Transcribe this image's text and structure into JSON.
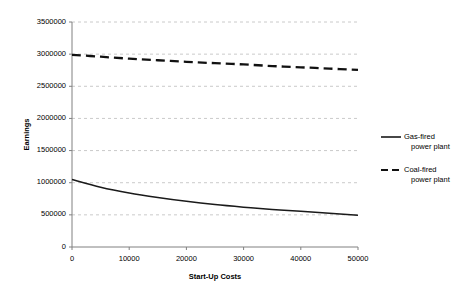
{
  "chart_data": {
    "type": "line",
    "title": "",
    "xlabel": "Start-Up Costs",
    "ylabel": "Earnings",
    "xlim": [
      0,
      50000
    ],
    "ylim": [
      0,
      3500000
    ],
    "xticks": [
      "0",
      "10000",
      "20000",
      "30000",
      "40000",
      "50000"
    ],
    "xtick_values": [
      0,
      10000,
      20000,
      30000,
      40000,
      50000
    ],
    "yticks": [
      "0",
      "500000",
      "1000000",
      "1500000",
      "2000000",
      "2500000",
      "3000000",
      "3500000"
    ],
    "ytick_values": [
      0,
      500000,
      1000000,
      1500000,
      2000000,
      2500000,
      3000000,
      3500000
    ],
    "grid": true,
    "grid_axis": "y",
    "grid_style": "dashed",
    "legend_position": "right",
    "x": [
      0,
      5000,
      10000,
      15000,
      20000,
      25000,
      30000,
      35000,
      40000,
      45000,
      50000
    ],
    "series": [
      {
        "name": "Gas-fired power plant",
        "style": "solid",
        "color": "#1a1a1a",
        "values": [
          1050000,
          930000,
          840000,
          770000,
          710000,
          660000,
          620000,
          585000,
          555000,
          525000,
          495000
        ]
      },
      {
        "name": "Coal-fired power plant",
        "style": "dashed",
        "color": "#111111",
        "values": [
          2990000,
          2960000,
          2930000,
          2905000,
          2880000,
          2860000,
          2840000,
          2815000,
          2795000,
          2775000,
          2755000
        ]
      }
    ]
  },
  "legend": {
    "entries": [
      {
        "line1": "Gas-fired",
        "line2": "power plant",
        "swatch": "solid-line-swatch"
      },
      {
        "line1": "Coal-fired",
        "line2": "power plant",
        "swatch": "dashed-line-swatch"
      }
    ]
  },
  "axes": {
    "x_title": "Start-Up Costs",
    "y_title": "Earnings"
  }
}
